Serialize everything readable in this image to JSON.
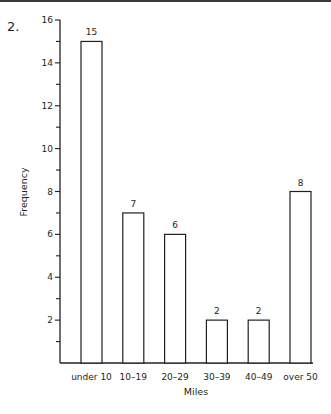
{
  "problem_number": "2.",
  "chart_data": {
    "type": "bar",
    "title": "",
    "categories": [
      "under 10",
      "10–19",
      "20–29",
      "30–39",
      "40–49",
      "over 50"
    ],
    "values": [
      15,
      7,
      6,
      2,
      2,
      8
    ],
    "data_labels": [
      "15",
      "7",
      "6",
      "2",
      "2",
      "8"
    ],
    "xlabel": "Miles",
    "ylabel": "Frequency",
    "ylim": [
      0,
      16
    ],
    "y_major_ticks": [
      2,
      4,
      6,
      8,
      10,
      12,
      14,
      16
    ],
    "y_minor_ticks": [
      1,
      3,
      5,
      7,
      9,
      11,
      13,
      15
    ],
    "grid": false,
    "legend": null,
    "bar_fill": "#ffffff",
    "bar_stroke": "#231f20"
  }
}
